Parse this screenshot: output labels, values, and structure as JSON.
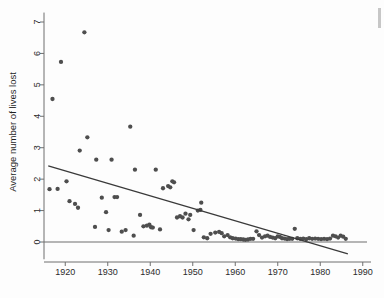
{
  "figure": {
    "background_color": "#fdfdfd",
    "point_color": "#4e4e4e",
    "line_color": "#3a3a3a",
    "axis_color": "#6f6f6f"
  },
  "chart_data": {
    "type": "scatter",
    "title": "",
    "xlabel": "",
    "ylabel": "Average number of lives lost",
    "xlim": [
      1915,
      1991
    ],
    "ylim": [
      -0.55,
      7.3
    ],
    "grid": false,
    "legend": null,
    "xticks": [
      1920,
      1930,
      1940,
      1950,
      1960,
      1970,
      1980,
      1990
    ],
    "xtick_labels": [
      "1920",
      "1930",
      "1940",
      "1950",
      "1960",
      "1970",
      "1980",
      "1990"
    ],
    "yticks": [
      0,
      1,
      2,
      3,
      4,
      5,
      6,
      7
    ],
    "ytick_labels": [
      "0",
      "1",
      "2",
      "3",
      "4",
      "5",
      "6",
      "7"
    ],
    "series": [
      {
        "name": "Average number of lives lost",
        "marker": "circle",
        "x": [
          1916.3,
          1917.0,
          1918.2,
          1919.0,
          1920.3,
          1921.0,
          1922.3,
          1923.0,
          1923.4,
          1924.5,
          1925.2,
          1927.0,
          1927.3,
          1928.6,
          1929.6,
          1930.2,
          1930.9,
          1931.6,
          1932.2,
          1933.3,
          1934.2,
          1935.3,
          1936.1,
          1936.4,
          1937.6,
          1938.4,
          1939.2,
          1939.8,
          1940.2,
          1940.6,
          1941.3,
          1942.3,
          1943.0,
          1944.2,
          1944.7,
          1945.2,
          1945.6,
          1946.3,
          1947.0,
          1947.6,
          1948.3,
          1949.0,
          1949.4,
          1950.2,
          1951.2,
          1951.8,
          1952.0,
          1952.6,
          1953.4,
          1954.2,
          1955.3,
          1956.2,
          1956.8,
          1957.4,
          1958.2,
          1958.8,
          1959.4,
          1960.1,
          1960.7,
          1961.3,
          1961.9,
          1962.4,
          1963.0,
          1963.6,
          1964.2,
          1965.0,
          1965.6,
          1966.3,
          1967.0,
          1967.6,
          1968.2,
          1968.8,
          1969.4,
          1970.0,
          1970.5,
          1971.0,
          1971.6,
          1972.2,
          1972.8,
          1973.4,
          1974.0,
          1974.6,
          1975.3,
          1976.0,
          1976.7,
          1977.4,
          1978.1,
          1978.8,
          1979.5,
          1980.2,
          1980.9,
          1981.6,
          1982.3,
          1983.0,
          1983.6,
          1984.2,
          1984.8,
          1985.4,
          1986.0
        ],
        "y": [
          1.68,
          4.55,
          1.69,
          5.73,
          1.93,
          1.3,
          1.21,
          1.09,
          2.91,
          6.67,
          3.33,
          0.48,
          2.62,
          1.41,
          0.95,
          0.38,
          2.62,
          1.43,
          1.43,
          0.33,
          0.38,
          3.67,
          0.2,
          2.3,
          0.86,
          0.5,
          0.52,
          0.55,
          0.47,
          0.46,
          2.3,
          0.4,
          1.71,
          1.78,
          1.74,
          1.93,
          1.9,
          0.78,
          0.82,
          0.78,
          0.9,
          0.72,
          0.86,
          0.38,
          1.0,
          1.02,
          1.25,
          0.15,
          0.12,
          0.26,
          0.3,
          0.32,
          0.28,
          0.18,
          0.22,
          0.15,
          0.12,
          0.11,
          0.09,
          0.09,
          0.08,
          0.07,
          0.08,
          0.1,
          0.1,
          0.34,
          0.22,
          0.14,
          0.18,
          0.2,
          0.16,
          0.14,
          0.12,
          0.18,
          0.16,
          0.12,
          0.11,
          0.09,
          0.1,
          0.1,
          0.42,
          0.12,
          0.1,
          0.11,
          0.09,
          0.12,
          0.1,
          0.11,
          0.1,
          0.09,
          0.1,
          0.09,
          0.11,
          0.2,
          0.18,
          0.14,
          0.2,
          0.17,
          0.1
        ]
      }
    ],
    "annotations": [
      {
        "name": "fit-line",
        "type": "linear-fit",
        "x_start": 1916.0,
        "y_start": 2.42,
        "x_end": 1986.5,
        "y_end": -0.38
      },
      {
        "name": "zero-reference-line",
        "type": "horizontal-rule",
        "y": 0.0,
        "x_start": 1915.0,
        "x_end": 1991.0
      }
    ]
  }
}
